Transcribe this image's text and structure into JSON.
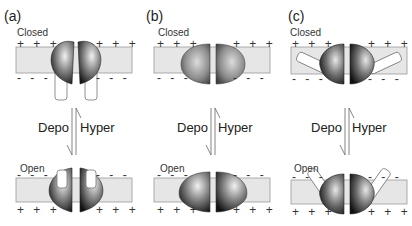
{
  "figure": {
    "panels": [
      {
        "label": "(a)",
        "top_state": "Closed",
        "bottom_state": "Open",
        "transition_down": "Depo",
        "transition_up": "Hyper",
        "top_charges_above": "+ + +",
        "top_charges_below": "- - -",
        "bottom_charges_above": "- - -",
        "bottom_charges_below": "+ + +"
      },
      {
        "label": "(b)",
        "top_state": "Closed",
        "bottom_state": "Open",
        "transition_down": "Depo",
        "transition_up": "Hyper",
        "top_charges_above": "+ + +",
        "top_charges_below": "- - -",
        "bottom_charges_above": "- - -",
        "bottom_charges_below": "+ + +"
      },
      {
        "label": "(c)",
        "top_state": "Closed",
        "bottom_state": "Open",
        "transition_down": "Depo",
        "transition_up": "Hyper",
        "top_charges_above": "+ + +",
        "top_charges_below": "- - -",
        "bottom_charges_above": "- - -",
        "bottom_charges_below": "+ + +"
      }
    ],
    "colors": {
      "membrane": "#e6e6e6",
      "membrane_border": "#9a9a9a",
      "protein_dark": "#1a1a1a",
      "protein_light": "#d8d8d8",
      "arrow": "#666666"
    }
  }
}
